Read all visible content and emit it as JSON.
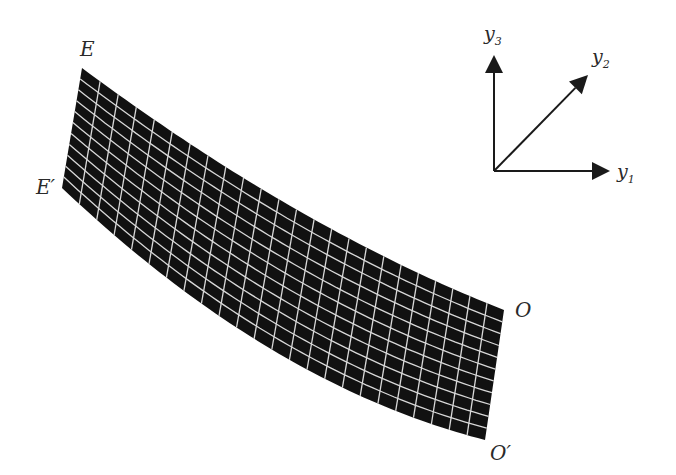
{
  "diagram": {
    "type": "curved-shell-mesh",
    "shell": {
      "fill_color": "#111111",
      "grid_color": "#d8d8d8",
      "columns": 24,
      "rows": 11,
      "corners": {
        "E": [
          82,
          68
        ],
        "E_prime": [
          62,
          188
        ],
        "O": [
          504,
          310
        ],
        "O_prime": [
          485,
          440
        ]
      },
      "top_edge_control": [
        300,
        230
      ],
      "bottom_edge_control": [
        270,
        385
      ]
    },
    "point_labels": [
      {
        "id": "E",
        "text": "E",
        "prime": "",
        "x": 80,
        "y": 56
      },
      {
        "id": "E-prime",
        "text": "E",
        "prime": "′",
        "x": 36,
        "y": 194
      },
      {
        "id": "O",
        "text": "O",
        "prime": "",
        "x": 515,
        "y": 317
      },
      {
        "id": "O-prime",
        "text": "O",
        "prime": "′",
        "x": 490,
        "y": 460
      }
    ],
    "axes": {
      "origin": [
        494,
        171
      ],
      "y1": {
        "label": "y",
        "subscript": "1",
        "tip": [
          610,
          171
        ]
      },
      "y2": {
        "label": "y",
        "subscript": "2",
        "tip": [
          588,
          75
        ]
      },
      "y3": {
        "label": "y",
        "subscript": "3",
        "tip": [
          494,
          55
        ]
      }
    }
  }
}
